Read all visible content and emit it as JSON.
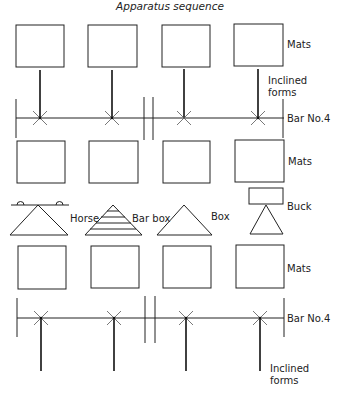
{
  "title": "Apparatus sequence",
  "labels": {
    "mats": "Mats",
    "inclined_forms_line1": "Inclined",
    "inclined_forms_line2": "forms",
    "bar": "Bar No.4",
    "horse": "Horse",
    "bar_box": "Bar box",
    "box": "Box",
    "buck": "Buck"
  },
  "rows": [
    {
      "type": "mats",
      "label": "Mats"
    },
    {
      "type": "inclined_forms",
      "label": "Inclined forms"
    },
    {
      "type": "bar",
      "label": "Bar No.4"
    },
    {
      "type": "mats",
      "label": "Mats"
    },
    {
      "type": "apparatus",
      "items": [
        "Horse",
        "Bar box",
        "Box",
        "Buck"
      ]
    },
    {
      "type": "mats",
      "label": "Mats"
    },
    {
      "type": "bar",
      "label": "Bar No.4"
    },
    {
      "type": "inclined_forms",
      "label": "Inclined forms"
    }
  ]
}
